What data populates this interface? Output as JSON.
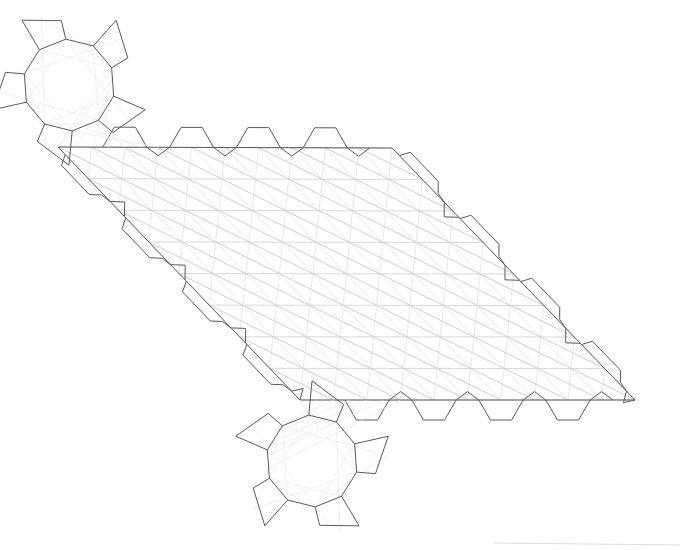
{
  "document": {
    "title": "Isometric Parallelogram Truss Panel Wireframe",
    "kind": "technical-line-drawing",
    "width": 680,
    "height": 550,
    "background_color": "#ffffff",
    "line_color_outline": "#5a5a60",
    "line_color_grid": "#c9c9cf",
    "line_color_diagonal": "#b9b9c2",
    "line_color_web": "#dcdce2"
  },
  "geometry": {
    "panel": {
      "name": "main-parallelogram-panel",
      "corner_top_left": [
        58,
        147
      ],
      "corner_top_right": [
        392,
        148
      ],
      "corner_bottom_right": [
        635,
        400
      ],
      "corner_bottom_left": [
        300,
        400
      ],
      "rows": 8,
      "columns": 10,
      "row_spacing_px": 31.5,
      "skew_dx_per_row": 30.3,
      "cell_diagonals": "both",
      "grid_visible": true
    },
    "top_edge_tabs": {
      "name": "top-edge-hex-tabs",
      "count": 4,
      "shape": "hexagonal",
      "direction": "up",
      "height_px": 20,
      "positions_x": [
        178,
        248,
        312,
        375
      ]
    },
    "bottom_edge_tabs": {
      "name": "bottom-edge-hex-tabs",
      "count": 4,
      "shape": "hexagonal",
      "direction": "down",
      "height_px": 20,
      "positions_x": [
        392,
        458,
        520,
        582
      ]
    },
    "left_edge_tabs": {
      "name": "left-edge-sawtooth-tabs",
      "count": 4,
      "shape": "sawtooth",
      "direction": "down-left",
      "depth_px": 34
    },
    "right_edge_tabs": {
      "name": "right-edge-sawtooth-tabs",
      "count": 4,
      "shape": "sawtooth",
      "direction": "down-right",
      "depth_px": 34
    },
    "hub_upper": {
      "name": "upper-gear-hub",
      "center": [
        69,
        85
      ],
      "radius_px": 46,
      "polygon_sides": 10,
      "spoke_tab_count": 5,
      "spoke_length_px": 34,
      "rotation_deg": 14
    },
    "hub_lower": {
      "name": "lower-gear-hub",
      "center": [
        312,
        461
      ],
      "radius_px": 46,
      "polygon_sides": 10,
      "spoke_tab_count": 5,
      "spoke_length_px": 34,
      "rotation_deg": 194
    },
    "bottom_artifact_line": {
      "name": "bottom-edge-artifact",
      "from": [
        494,
        543
      ],
      "to": [
        680,
        545
      ]
    }
  },
  "labels": {
    "none_visible": ""
  }
}
